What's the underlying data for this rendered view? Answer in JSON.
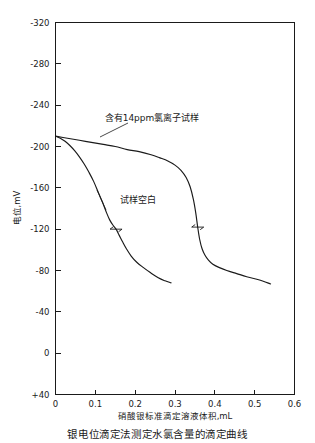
{
  "figure": {
    "caption": "银电位滴定法测定水氯含量的滴定曲线"
  },
  "chart_data": {
    "type": "line",
    "title": "",
    "xlabel": "硝酸银标准滴定溶液体积,mL",
    "ylabel": "电位,mV",
    "xlim": [
      0,
      0.6
    ],
    "ylim": [
      40,
      -320
    ],
    "xticks": [
      0,
      0.1,
      0.2,
      0.3,
      0.4,
      0.5,
      0.6
    ],
    "xtick_labels": [
      "0",
      "0.1",
      "0.2",
      "0.3",
      "0.4",
      "0.5",
      "0.6"
    ],
    "yticks": [
      -320,
      -280,
      -240,
      -200,
      -160,
      -120,
      -80,
      -40,
      0,
      40
    ],
    "ytick_labels": [
      "-320",
      "-280",
      "-240",
      "-200",
      "-160",
      "-120",
      "-80",
      "-40",
      "0",
      "+40"
    ],
    "grid": false,
    "legend_position": "inline-annotation",
    "series": [
      {
        "name": "含有14ppm氯离子试样",
        "label_text": "含有14ppm氯离子试样",
        "color": "#1a1a1a",
        "inflection_point": {
          "x": 0.357,
          "y": -122
        },
        "x": [
          0.0,
          0.03,
          0.06,
          0.09,
          0.12,
          0.15,
          0.18,
          0.21,
          0.24,
          0.262,
          0.282,
          0.3,
          0.315,
          0.328,
          0.338,
          0.346,
          0.352,
          0.357,
          0.362,
          0.368,
          0.375,
          0.384,
          0.395,
          0.41,
          0.43,
          0.455,
          0.48,
          0.51,
          0.54
        ],
        "y": [
          -210,
          -208,
          -206,
          -204,
          -202,
          -200,
          -197,
          -195,
          -192,
          -189,
          -186,
          -182,
          -177,
          -170,
          -161,
          -149,
          -136,
          -122,
          -110,
          -101,
          -95,
          -90,
          -86,
          -83,
          -80,
          -77,
          -74,
          -71,
          -67
        ]
      },
      {
        "name": "试样空白",
        "label_text": "试样空白",
        "color": "#1a1a1a",
        "inflection_point": {
          "x": 0.152,
          "y": -120
        },
        "x": [
          0.0,
          0.012,
          0.024,
          0.036,
          0.048,
          0.06,
          0.072,
          0.084,
          0.096,
          0.108,
          0.118,
          0.128,
          0.136,
          0.144,
          0.152,
          0.16,
          0.168,
          0.178,
          0.19,
          0.204,
          0.22,
          0.238,
          0.258,
          0.275,
          0.29
        ],
        "y": [
          -210,
          -208,
          -205,
          -201,
          -196,
          -190,
          -183,
          -175,
          -166,
          -155,
          -146,
          -136,
          -129,
          -124,
          -120,
          -114,
          -108,
          -101,
          -94,
          -88,
          -83,
          -78,
          -73,
          -70,
          -68
        ]
      }
    ],
    "annotations": [
      {
        "text": "含有14ppm氯离子试样",
        "x": 0.248,
        "y": -232
      },
      {
        "text": "试样空白",
        "x": 0.158,
        "y": -130
      }
    ]
  }
}
